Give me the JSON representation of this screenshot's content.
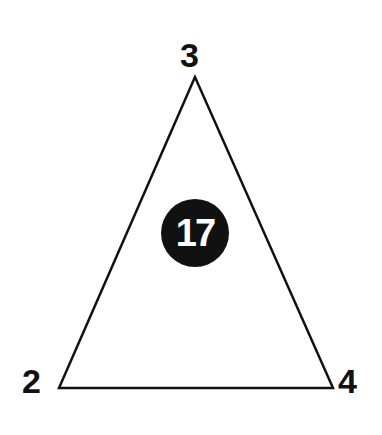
{
  "diagram": {
    "type": "number-triangle-puzzle",
    "vertices": {
      "top": "3",
      "bottom_left": "2",
      "bottom_right": "4"
    },
    "center_value": "17",
    "colors": {
      "stroke": "#111111",
      "circle_fill": "#111111",
      "center_text": "#ffffff",
      "background": "#ffffff"
    }
  }
}
